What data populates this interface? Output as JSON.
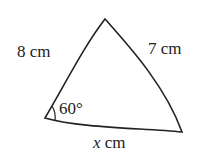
{
  "diagram": {
    "type": "triangle",
    "vertices": {
      "top": [
        105,
        19
      ],
      "bottom_left": [
        45,
        118
      ],
      "bottom_right": [
        182,
        132
      ]
    },
    "sides": {
      "left": "8 cm",
      "right": "7 cm",
      "bottom": {
        "var": "x",
        "unit": " cm"
      }
    },
    "angle": "60°",
    "stroke_color": "#222222"
  }
}
